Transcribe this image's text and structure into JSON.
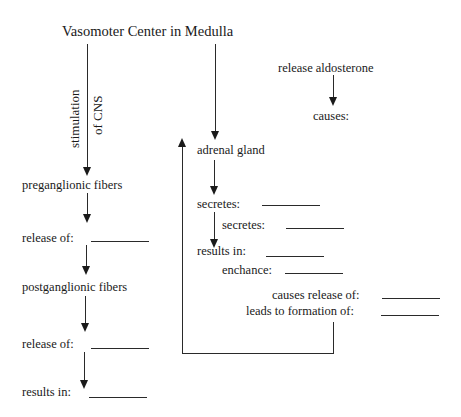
{
  "diagram": {
    "title": "Vasomoter Center in Medulla",
    "left_column": {
      "edge_label_line1": "stimulation",
      "edge_label_line2": "of CNS",
      "nodes": [
        {
          "label": "preganglionic fibers"
        },
        {
          "label": "release of:",
          "blank": ""
        },
        {
          "label": "postganglionic fibers"
        },
        {
          "label": "release of:",
          "blank": ""
        },
        {
          "label": "results in:",
          "blank": ""
        }
      ]
    },
    "middle_column": {
      "nodes": [
        {
          "label": "adrenal gland"
        },
        {
          "label": "secretes:",
          "blank": ""
        },
        {
          "label": "secretes:",
          "blank": ""
        },
        {
          "label": "results in:",
          "blank": ""
        },
        {
          "label": "enchance:",
          "blank": ""
        },
        {
          "label": "causes release of:",
          "blank": ""
        },
        {
          "label": "leads to formation of:",
          "blank": ""
        }
      ],
      "feedback_loop": "leads to formation of → back to adrenal gland"
    },
    "right_column": {
      "nodes": [
        {
          "label": "release aldosterone"
        },
        {
          "label": "causes:"
        }
      ]
    }
  },
  "colors": {
    "background": "#ffffff",
    "ink": "#1a1a1a"
  }
}
